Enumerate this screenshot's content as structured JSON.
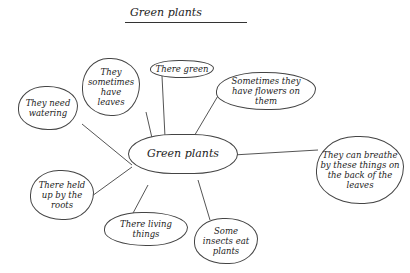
{
  "title": "Green plants",
  "center": {
    "label": "Green plants"
  },
  "nodes": [
    {
      "id": "watering",
      "label": "They need watering"
    },
    {
      "id": "leaves",
      "label": "They sometimes have leaves"
    },
    {
      "id": "green",
      "label": "There green"
    },
    {
      "id": "flowers",
      "label": "Sometimes they have flowers on them"
    },
    {
      "id": "breathe",
      "label": "They can breathe by these things on the back of the leaves"
    },
    {
      "id": "roots",
      "label": "There held up by the roots"
    },
    {
      "id": "living",
      "label": "There living things"
    },
    {
      "id": "insects",
      "label": "Some insects eat plants"
    }
  ]
}
